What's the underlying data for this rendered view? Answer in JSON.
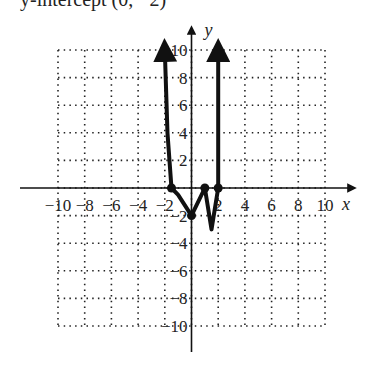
{
  "cut_text": "y-intercept (0, −2)",
  "chart_data": {
    "type": "line",
    "title": "",
    "xlabel": "x",
    "ylabel": "y",
    "xlim": [
      -10,
      10
    ],
    "ylim": [
      -10,
      10
    ],
    "grid": true,
    "grid_style": "dotted",
    "x_ticks": [
      -10,
      -8,
      -6,
      -4,
      -2,
      2,
      4,
      6,
      8,
      10
    ],
    "y_ticks": [
      -10,
      -8,
      -6,
      -4,
      -2,
      2,
      4,
      6,
      8,
      10
    ],
    "x_tick_labels": [
      "−10",
      "−8",
      "−6",
      "−4",
      "−2",
      "2",
      "4",
      "6",
      "8",
      "10"
    ],
    "y_tick_labels": [
      "−10",
      "−8",
      "−6",
      "−4",
      "−2",
      "2",
      "4",
      "6",
      "8",
      "10"
    ],
    "series": [
      {
        "name": "polynomial",
        "x": [
          -2,
          -1.8,
          -1.5,
          -1,
          0,
          1,
          1.5,
          2,
          2,
          2
        ],
        "y": [
          10,
          4,
          0,
          -0.5,
          -2,
          0,
          -3,
          0,
          4,
          10
        ],
        "end_arrows": true
      }
    ],
    "marked_points": [
      {
        "x": -1.5,
        "y": 0
      },
      {
        "x": 0,
        "y": -2
      },
      {
        "x": 1,
        "y": 0
      },
      {
        "x": 2,
        "y": 0
      }
    ]
  }
}
